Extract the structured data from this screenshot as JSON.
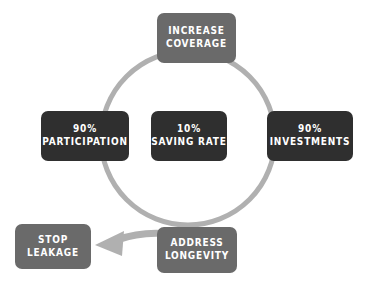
{
  "diagram": {
    "type": "cycle-diagram",
    "background_color": "#ffffff",
    "ring": {
      "name": "cycle-ring",
      "color": "#b0b0b0",
      "stroke_width": 5,
      "center_x": 188,
      "center_y": 138,
      "radius": 87,
      "direction": "clockwise"
    },
    "arrow": {
      "name": "outflow-arrow",
      "color": "#b0b0b0",
      "label": "",
      "from": "address-longevity",
      "to": "stop-leakage",
      "direction": "left"
    },
    "nodes": [
      {
        "id": "increase-coverage",
        "lines": [
          "INCREASE",
          "COVERAGE"
        ],
        "color": "#6a6a6a",
        "text_color": "#ffffff",
        "position": "top"
      },
      {
        "id": "participation",
        "lines": [
          "90%",
          "PARTICIPATION"
        ],
        "color": "#2f2f2f",
        "text_color": "#ffffff",
        "position": "left"
      },
      {
        "id": "saving-rate",
        "lines": [
          "10%",
          "SAVING RATE"
        ],
        "color": "#2f2f2f",
        "text_color": "#ffffff",
        "position": "center"
      },
      {
        "id": "investments",
        "lines": [
          "90%",
          "INVESTMENTS"
        ],
        "color": "#2f2f2f",
        "text_color": "#ffffff",
        "position": "right"
      },
      {
        "id": "address-longevity",
        "lines": [
          "ADDRESS",
          "LONGEVITY"
        ],
        "color": "#6a6a6a",
        "text_color": "#ffffff",
        "position": "bottom"
      },
      {
        "id": "stop-leakage",
        "lines": [
          "STOP",
          "LEAKAGE"
        ],
        "color": "#6a6a6a",
        "text_color": "#ffffff",
        "position": "bottom-left"
      }
    ]
  }
}
